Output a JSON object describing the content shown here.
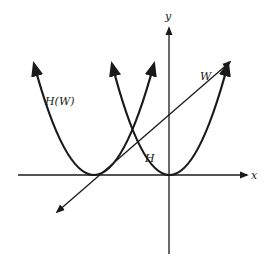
{
  "diagram": {
    "labels": {
      "x_axis": "x",
      "y_axis": "y",
      "line": "W",
      "shifted_parabola": "H(W)",
      "parabola": "H"
    },
    "elements": [
      {
        "name": "x-axis",
        "type": "axis"
      },
      {
        "name": "y-axis",
        "type": "axis"
      },
      {
        "name": "parabola-H",
        "type": "curve",
        "description": "parabola with vertex at origin"
      },
      {
        "name": "parabola-H-of-W",
        "type": "curve",
        "description": "parabola shifted left, tangent to x-axis"
      },
      {
        "name": "line-W",
        "type": "line",
        "description": "straight line with positive slope"
      }
    ],
    "colors": {
      "ink": "#1a1a1a",
      "background": "#ffffff"
    }
  }
}
